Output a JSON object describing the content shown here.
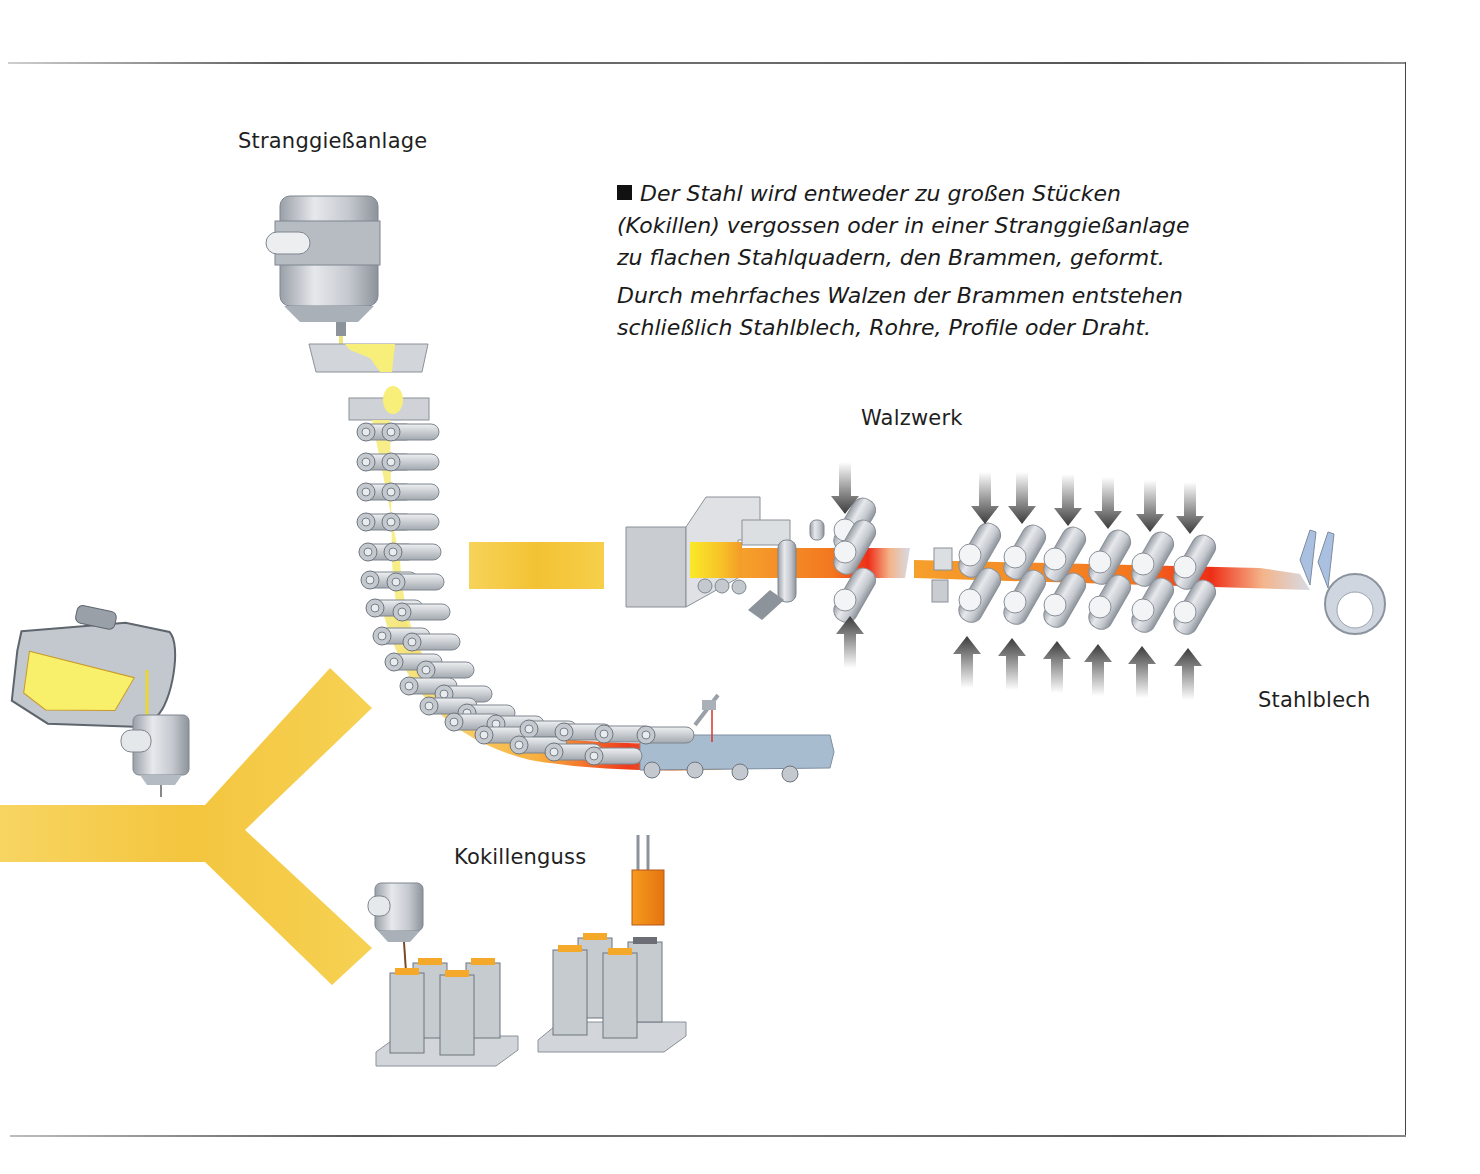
{
  "page": {
    "frame": {
      "line_color": "#555555"
    }
  },
  "labels": {
    "continuous_casting": "Stranggießanlage",
    "rolling_mill": "Walzwerk",
    "steel_sheet": "Stahlblech",
    "ingot_casting": "Kokillenguss"
  },
  "caption": {
    "bullet_icon": "black-square-icon",
    "paragraph_1": "Der Stahl wird entweder zu großen Stücken (Kokillen) vergossen oder in einer Stranggießanlage zu flachen Stahlquadern, den Brammen, geformt.",
    "paragraph_2": "Durch mehrfaches Walzen der Brammen entstehen schließlich Stahlblech, Rohre, Profile oder Draht."
  },
  "diagram": {
    "stages": [
      {
        "id": "converter",
        "description": "ladle pouring molten steel into tundish"
      },
      {
        "id": "continuous_casting",
        "label_ref": "labels.continuous_casting"
      },
      {
        "id": "rolling_mill",
        "label_ref": "labels.rolling_mill"
      },
      {
        "id": "steel_sheet",
        "label_ref": "labels.steel_sheet"
      },
      {
        "id": "ingot_casting",
        "label_ref": "labels.ingot_casting"
      }
    ],
    "colors": {
      "flow_arrow": "#f4c430",
      "molten_steel": "#f7ec7a",
      "hot_steel": "#f58a1f",
      "glowing_steel": "#ee3a1a",
      "cooled_steel": "#9fb3c8",
      "machine_grey": "#c9ccd0"
    }
  }
}
